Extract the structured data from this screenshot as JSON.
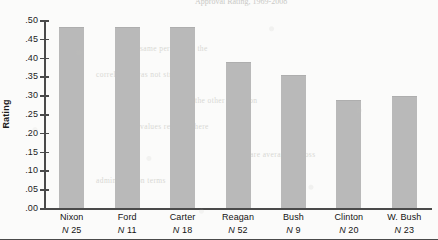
{
  "chart_data": {
    "type": "bar",
    "title": "Approval Rating, 1969-2008",
    "xlabel": "",
    "ylabel": "Rating",
    "ylim": [
      0.0,
      0.5
    ],
    "grid": false,
    "legend": null,
    "ytick_labels": [
      ".50",
      ".45",
      ".40",
      ".35",
      ".30",
      ".25",
      ".20",
      ".15",
      ".10",
      ".05",
      ".00"
    ],
    "ytick_values": [
      0.5,
      0.45,
      0.4,
      0.35,
      0.3,
      0.25,
      0.2,
      0.15,
      0.1,
      0.05,
      0.0
    ],
    "categories": [
      "Nixon",
      "Ford",
      "Carter",
      "Reagan",
      "Bush",
      "Clinton",
      "W. Bush"
    ],
    "values": [
      0.48,
      0.48,
      0.48,
      0.385,
      0.35,
      0.285,
      0.295
    ],
    "annotations": [
      "N 25",
      "N 11",
      "N 18",
      "N 52",
      "N 9",
      "N 20",
      "N 23"
    ],
    "sample_sizes": [
      25,
      11,
      18,
      52,
      9,
      20,
      23
    ],
    "bar_color": "#b9b9b9",
    "axis_color": "#4a4a4a"
  },
  "chart": {
    "title": "Approval Rating, 1969-2008",
    "y_axis_title": "Rating",
    "ticks": [
      {
        "label": ".50",
        "value": 0.5
      },
      {
        "label": ".45",
        "value": 0.45
      },
      {
        "label": ".40",
        "value": 0.4
      },
      {
        "label": ".35",
        "value": 0.35
      },
      {
        "label": ".30",
        "value": 0.3
      },
      {
        "label": ".25",
        "value": 0.25
      },
      {
        "label": ".20",
        "value": 0.2
      },
      {
        "label": ".15",
        "value": 0.15
      },
      {
        "label": ".10",
        "value": 0.1
      },
      {
        "label": ".05",
        "value": 0.05
      },
      {
        "label": ".00",
        "value": 0.0
      }
    ],
    "bars": [
      {
        "name": "Nixon",
        "n_label": "N 25",
        "value": 0.48
      },
      {
        "name": "Ford",
        "n_label": "N 11",
        "value": 0.48
      },
      {
        "name": "Carter",
        "n_label": "N 18",
        "value": 0.48
      },
      {
        "name": "Reagan",
        "n_label": "N 52",
        "value": 0.385
      },
      {
        "name": "Bush",
        "n_label": "N 9",
        "value": 0.35
      },
      {
        "name": "Clinton",
        "n_label": "N 20",
        "value": 0.285
      },
      {
        "name": "W. Bush",
        "n_label": "N 23",
        "value": 0.295
      }
    ]
  },
  "page_bleed": [
    {
      "text": "of the same period and the",
      "x": 118,
      "y": 44
    },
    {
      "text": "correlation was not strong",
      "x": 96,
      "y": 70
    },
    {
      "text": "in the other direction",
      "x": 186,
      "y": 96
    },
    {
      "text": "values reported here",
      "x": 140,
      "y": 122
    },
    {
      "text": "are averages across",
      "x": 250,
      "y": 150
    },
    {
      "text": "administration terms",
      "x": 96,
      "y": 176
    }
  ]
}
